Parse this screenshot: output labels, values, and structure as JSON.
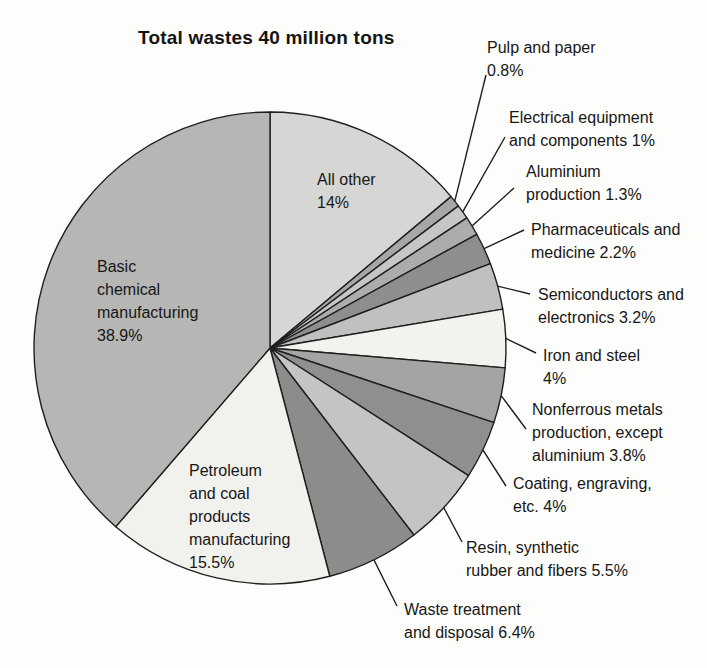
{
  "chart_data": {
    "type": "pie",
    "title": "Total wastes 40 million tons",
    "total_label": "40 million tons",
    "unit": "percent",
    "start_angle_deg": 0,
    "direction": "clockwise",
    "legend_position": "labels-with-leader-lines",
    "outline_color": "#1f1f1f",
    "text_color": "#171717",
    "background_color": "#fdfdfb",
    "slices": [
      {
        "id": "all-other",
        "name": "All other",
        "value": 14,
        "pct_label": "14%",
        "color": "#d6d6d4",
        "label_placement": "inside",
        "label_lines": [
          "All other",
          "14%"
        ]
      },
      {
        "id": "pulp-and-paper",
        "name": "Pulp and paper",
        "value": 0.8,
        "pct_label": "0.8%",
        "color": "#a7a7a5",
        "label_placement": "outside",
        "label_lines": [
          "Pulp and paper",
          "0.8%"
        ]
      },
      {
        "id": "electrical-equipment",
        "name": "Electrical equipment and components",
        "value": 1,
        "pct_label": "1%",
        "color": "#c6c6c4",
        "label_placement": "outside",
        "label_lines": [
          "Electrical equipment",
          "and components 1%"
        ]
      },
      {
        "id": "aluminium-production",
        "name": "Aluminium production",
        "value": 1.3,
        "pct_label": "1.3%",
        "color": "#acacaa",
        "label_placement": "outside",
        "label_lines": [
          "Aluminium",
          "production 1.3%"
        ]
      },
      {
        "id": "pharmaceuticals",
        "name": "Pharmaceuticals and medicine",
        "value": 2.2,
        "pct_label": "2.2%",
        "color": "#8e8e8c",
        "label_placement": "outside",
        "label_lines": [
          "Pharmaceuticals and",
          "medicine 2.2%"
        ]
      },
      {
        "id": "semiconductors",
        "name": "Semiconductors and electronics",
        "value": 3.2,
        "pct_label": "3.2%",
        "color": "#c0c0be",
        "label_placement": "outside",
        "label_lines": [
          "Semiconductors and",
          "electronics 3.2%"
        ]
      },
      {
        "id": "iron-and-steel",
        "name": "Iron and steel",
        "value": 4,
        "pct_label": "4%",
        "color": "#f2f2ee",
        "label_placement": "outside",
        "label_lines": [
          "Iron and steel",
          "4%"
        ]
      },
      {
        "id": "nonferrous-metals",
        "name": "Nonferrous metals production, except aluminium",
        "value": 3.8,
        "pct_label": "3.8%",
        "color": "#a4a4a2",
        "label_placement": "outside",
        "label_lines": [
          "Nonferrous metals",
          "production, except",
          "aluminium 3.8%"
        ]
      },
      {
        "id": "coating-engraving",
        "name": "Coating, engraving, etc.",
        "value": 4,
        "pct_label": "4%",
        "color": "#8f8f8d",
        "label_placement": "outside",
        "label_lines": [
          "Coating, engraving,",
          "etc. 4%"
        ]
      },
      {
        "id": "resin-rubber-fibers",
        "name": "Resin, synthetic rubber and fibers",
        "value": 5.5,
        "pct_label": "5.5%",
        "color": "#c4c4c2",
        "label_placement": "outside",
        "label_lines": [
          "Resin, synthetic",
          "rubber and fibers 5.5%"
        ]
      },
      {
        "id": "waste-treatment",
        "name": "Waste treatment and disposal",
        "value": 6.4,
        "pct_label": "6.4%",
        "color": "#8c8c8a",
        "label_placement": "outside",
        "label_lines": [
          "Waste treatment",
          "and disposal 6.4%"
        ]
      },
      {
        "id": "petroleum-coal",
        "name": "Petroleum and coal products manufacturing",
        "value": 15.5,
        "pct_label": "15.5%",
        "color": "#f1f1ed",
        "label_placement": "inside",
        "label_lines": [
          "Petroleum",
          "and coal",
          "products",
          "manufacturing",
          "15.5%"
        ]
      },
      {
        "id": "basic-chemical",
        "name": "Basic chemical manufacturing",
        "value": 38.9,
        "pct_label": "38.9%",
        "color": "#b6b6b4",
        "label_placement": "inside",
        "label_lines": [
          "Basic",
          "chemical",
          "manufacturing",
          "38.9%"
        ]
      }
    ]
  }
}
